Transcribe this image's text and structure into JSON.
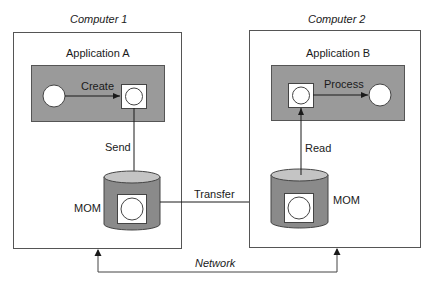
{
  "diagram": {
    "computers": [
      {
        "title": "Computer 1",
        "application": "Application A",
        "action": "Create",
        "queue_action": "Send",
        "queue_label": "MOM"
      },
      {
        "title": "Computer 2",
        "application": "Application B",
        "action": "Process",
        "queue_action": "Read",
        "queue_label": "MOM"
      }
    ],
    "transfer_label": "Transfer",
    "network_label": "Network",
    "colors": {
      "app_fill": "#9a9a9a",
      "cylinder_body": "#8a8a8a",
      "cylinder_top": "#c4c4c4",
      "stroke": "#3a3a3a"
    }
  }
}
